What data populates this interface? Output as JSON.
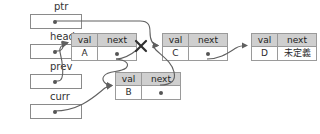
{
  "diagram": {
    "pointers": [
      {
        "name": "ptr",
        "label": "ptr",
        "x": 30,
        "y": 14,
        "w": 52,
        "h": 15,
        "label_x": 54,
        "label_y": 2
      },
      {
        "name": "head",
        "label": "head",
        "x": 30,
        "y": 44,
        "w": 52,
        "h": 15,
        "label_x": 50,
        "label_y": 32
      },
      {
        "name": "prev",
        "label": "prev",
        "x": 30,
        "y": 74,
        "w": 52,
        "h": 15,
        "label_x": 50,
        "label_y": 62
      },
      {
        "name": "curr",
        "label": "curr",
        "x": 30,
        "y": 104,
        "w": 52,
        "h": 15,
        "label_x": 50,
        "label_y": 92
      }
    ],
    "header": {
      "val": "val",
      "next": "next"
    },
    "nodes": [
      {
        "name": "node-a",
        "val": "A",
        "next_text": "",
        "next_is_pointer": true,
        "x": 71,
        "y": 33,
        "w": 66
      },
      {
        "name": "node-c",
        "val": "C",
        "next_text": "",
        "next_is_pointer": true,
        "x": 162,
        "y": 33,
        "w": 66
      },
      {
        "name": "node-d",
        "val": "D",
        "next_text": "未定義",
        "next_is_pointer": false,
        "x": 251,
        "y": 33,
        "w": 66
      },
      {
        "name": "node-b",
        "val": "B",
        "next_text": "",
        "next_is_pointer": true,
        "x": 115,
        "y": 72,
        "w": 66
      }
    ],
    "colors": {
      "header_fill": "#cfcfcf",
      "box_border": "#9a9a9a",
      "wire": "#606060",
      "dot": "#555555",
      "x_mark": "#2f2f2f",
      "background": "#ffffff"
    },
    "annotations": {
      "broken_link": "x-mark",
      "undefined_label": "未定義"
    }
  }
}
